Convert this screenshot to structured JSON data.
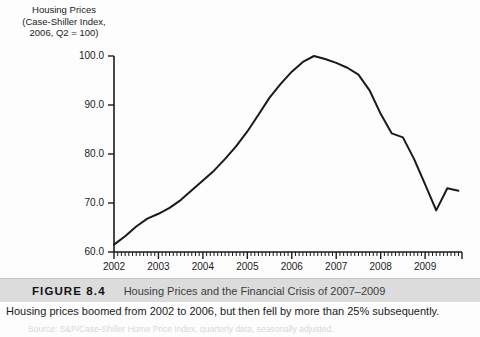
{
  "figure": {
    "number_label": "FIGURE 8.4",
    "title": "Housing Prices and the Financial Crisis of 2007–2009",
    "caption": "Housing prices boomed from 2002 to 2006, but then fell by more than 25% subsequently.",
    "source_line": "Source: S&P/Case-Shiller Home Price Index, quarterly data, seasonally adjusted.",
    "bar_color": "#dcdcdc"
  },
  "chart_data": {
    "type": "line",
    "title": "Housing Prices",
    "title_lines": [
      "Housing Prices",
      "(Case-Shiller Index,",
      "2006, Q2 = 100)"
    ],
    "xlabel": "",
    "ylabel": "Housing Prices (Case-Shiller Index, 2006, Q2 = 100)",
    "xlim": [
      2002.0,
      2009.83
    ],
    "ylim": [
      60.0,
      100.0
    ],
    "yticks": [
      60.0,
      70.0,
      80.0,
      90.0,
      100.0
    ],
    "ytick_labels": [
      "60.0",
      "70.0",
      "80.0",
      "90.0",
      "100.0"
    ],
    "xticks": [
      2002,
      2003,
      2004,
      2005,
      2006,
      2007,
      2008,
      2009
    ],
    "xtick_labels": [
      "2002",
      "2003",
      "2004",
      "2005",
      "2006",
      "2007",
      "2008",
      "2009"
    ],
    "minor_ticks_per_year": 12,
    "grid": false,
    "legend": false,
    "line_color": "#1a1a1a",
    "line_width": 2.0,
    "series": [
      {
        "name": "Case-Shiller Home Price Index",
        "x": [
          2002.0,
          2002.25,
          2002.5,
          2002.75,
          2003.0,
          2003.25,
          2003.5,
          2003.75,
          2004.0,
          2004.25,
          2004.5,
          2004.75,
          2005.0,
          2005.25,
          2005.5,
          2005.75,
          2006.0,
          2006.25,
          2006.5,
          2006.75,
          2007.0,
          2007.25,
          2007.5,
          2007.75,
          2008.0,
          2008.25,
          2008.5,
          2008.75,
          2009.0,
          2009.25,
          2009.5,
          2009.75
        ],
        "values": [
          61.5,
          63.2,
          65.2,
          66.8,
          67.8,
          69.0,
          70.6,
          72.6,
          74.6,
          76.6,
          79.0,
          81.6,
          84.6,
          88.0,
          91.5,
          94.3,
          96.8,
          98.8,
          100.0,
          99.4,
          98.6,
          97.6,
          96.2,
          93.0,
          88.2,
          84.2,
          83.4,
          79.0,
          73.8,
          68.5,
          73.0,
          72.5
        ]
      }
    ],
    "annotations": {
      "peak_value": 100.0,
      "peak_period": "2006 Q2",
      "trough_value": 68.5,
      "trough_period": "2009 Q1",
      "start_value": 61.5,
      "end_value": 72.5
    }
  }
}
